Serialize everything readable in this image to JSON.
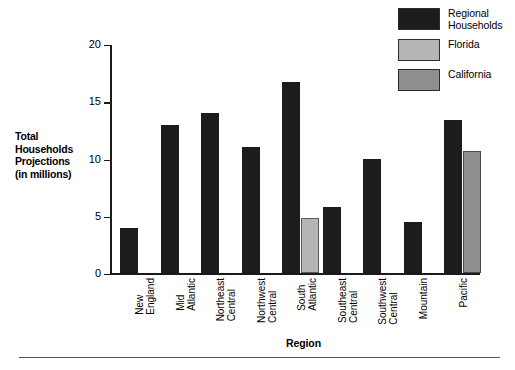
{
  "chart_data": {
    "type": "bar",
    "title": "",
    "subtitle": "",
    "xlabel": "Region",
    "ylabel": "Total Households Projections (in millions)",
    "ylim": [
      0,
      20
    ],
    "yticks": [
      0,
      5,
      10,
      15,
      20
    ],
    "grid": false,
    "legend_position": "top-right",
    "categories": [
      "New England",
      "Mid Atlantic",
      "Northeast Central",
      "Northwest Central",
      "South Atlantic",
      "Southeast Central",
      "Southwest Central",
      "Mountain",
      "Pacific"
    ],
    "category_lines": [
      [
        "New",
        "England"
      ],
      [
        "Mid",
        "Atlantic"
      ],
      [
        "Northeast",
        "Central"
      ],
      [
        "Northwest",
        "Central"
      ],
      [
        "South",
        "Atlantic"
      ],
      [
        "Southeast",
        "Central"
      ],
      [
        "Southwest",
        "Central"
      ],
      [
        "Mountain",
        ""
      ],
      [
        "Pacific",
        ""
      ]
    ],
    "series": [
      {
        "name": "Regional Households",
        "color": "#1c1c1c",
        "values": [
          4.0,
          13.0,
          14.0,
          11.0,
          16.7,
          5.8,
          10.0,
          4.5,
          13.4
        ]
      },
      {
        "name": "Florida",
        "color": "#b5b5b5",
        "values": [
          null,
          null,
          null,
          null,
          4.8,
          null,
          null,
          null,
          null
        ]
      },
      {
        "name": "California",
        "color": "#8f8f8f",
        "values": [
          null,
          null,
          null,
          null,
          null,
          null,
          null,
          null,
          10.7
        ]
      }
    ]
  },
  "legend": {
    "items": [
      {
        "label": "Regional\nHouseholds",
        "color": "#1c1c1c"
      },
      {
        "label": "Florida",
        "color": "#b5b5b5"
      },
      {
        "label": "California",
        "color": "#8f8f8f"
      }
    ]
  },
  "yaxis": {
    "title_lines": [
      "Total",
      "Households",
      "Projections",
      "(in millions)"
    ],
    "tick_labels": [
      "20",
      "15",
      "10",
      "5",
      "0"
    ]
  },
  "xaxis": {
    "title": "Region"
  }
}
